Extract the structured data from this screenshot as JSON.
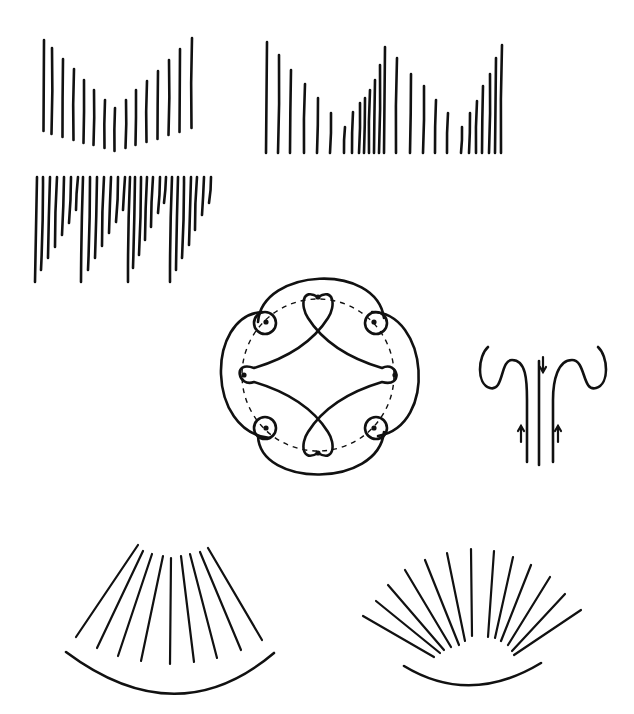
{
  "page": {
    "width": 634,
    "height": 714,
    "background": "#ffffff",
    "ink": "#111111"
  },
  "figures": {
    "v_comb": {
      "lines": [
        [
          44,
          40,
          131
        ],
        [
          52,
          48,
          134
        ],
        [
          63,
          59,
          137
        ],
        [
          74,
          69,
          140
        ],
        [
          84,
          80,
          143
        ],
        [
          94,
          90,
          145
        ],
        [
          105,
          100,
          148
        ],
        [
          115,
          108,
          151
        ],
        [
          126,
          100,
          148
        ],
        [
          136,
          90,
          145
        ],
        [
          147,
          81,
          142
        ],
        [
          158,
          71,
          139
        ],
        [
          169,
          60,
          135
        ],
        [
          180,
          49,
          132
        ],
        [
          192,
          38,
          128
        ]
      ]
    },
    "double_sawtooth_comb": {
      "bottom": 153,
      "lines": [
        [
          267,
          42
        ],
        [
          279,
          55
        ],
        [
          291,
          70
        ],
        [
          305,
          84
        ],
        [
          318,
          98
        ],
        [
          331,
          113
        ],
        [
          345,
          127
        ],
        [
          353,
          112
        ],
        [
          360,
          103
        ],
        [
          365,
          98
        ],
        [
          370,
          90
        ],
        [
          375,
          80
        ],
        [
          380,
          65
        ],
        [
          385,
          47
        ],
        [
          397,
          58
        ],
        [
          411,
          74
        ],
        [
          424,
          86
        ],
        [
          436,
          100
        ],
        [
          448,
          113
        ],
        [
          462,
          127
        ],
        [
          470,
          113
        ],
        [
          477,
          101
        ],
        [
          483,
          86
        ],
        [
          490,
          74
        ],
        [
          496,
          58
        ],
        [
          502,
          45
        ]
      ]
    },
    "hanging_sawtooth": {
      "top": 177,
      "lines": [
        [
          36,
          282
        ],
        [
          42,
          270
        ],
        [
          49,
          258
        ],
        [
          56,
          247
        ],
        [
          63,
          235
        ],
        [
          70,
          223
        ],
        [
          77,
          210
        ],
        [
          82,
          282
        ],
        [
          89,
          270
        ],
        [
          96,
          258
        ],
        [
          103,
          246
        ],
        [
          110,
          233
        ],
        [
          117,
          222
        ],
        [
          124,
          210
        ],
        [
          129,
          282
        ],
        [
          134,
          268
        ],
        [
          140,
          255
        ],
        [
          146,
          240
        ],
        [
          152,
          227
        ],
        [
          159,
          213
        ],
        [
          165,
          203
        ],
        [
          171,
          282
        ],
        [
          177,
          270
        ],
        [
          183,
          258
        ],
        [
          190,
          245
        ],
        [
          196,
          230
        ],
        [
          203,
          215
        ],
        [
          210,
          203
        ]
      ]
    },
    "knot_circle": {
      "center": [
        318,
        375
      ],
      "dashed_radius": 76,
      "dots": [
        [
          318,
          297
        ],
        [
          374,
          322
        ],
        [
          395,
          375
        ],
        [
          374,
          428
        ],
        [
          318,
          453
        ],
        [
          266,
          428
        ],
        [
          244,
          375
        ],
        [
          266,
          322
        ]
      ]
    },
    "fountain": {
      "arrows": [
        {
          "x": 543,
          "y1": 357,
          "y2": 372,
          "dir": "down"
        },
        {
          "x": 521,
          "y1": 442,
          "y2": 426,
          "dir": "up"
        },
        {
          "x": 558,
          "y1": 442,
          "y2": 426,
          "dir": "up"
        }
      ]
    },
    "fan_arc": {
      "lines": [
        [
          138,
          545,
          76,
          637
        ],
        [
          143,
          551,
          97,
          648
        ],
        [
          152,
          554,
          118,
          656
        ],
        [
          163,
          556,
          141,
          661
        ],
        [
          171,
          558,
          170,
          664
        ],
        [
          181,
          556,
          194,
          662
        ],
        [
          190,
          554,
          217,
          658
        ],
        [
          200,
          552,
          241,
          650
        ],
        [
          208,
          548,
          262,
          640
        ]
      ],
      "arc": "M 66 652 Q 177 735 274 653"
    },
    "sunburst": {
      "lines": [
        [
          363,
          616,
          434,
          657
        ],
        [
          376,
          601,
          440,
          653
        ],
        [
          388,
          585,
          444,
          650
        ],
        [
          405,
          570,
          451,
          647
        ],
        [
          425,
          560,
          459,
          645
        ],
        [
          447,
          553,
          465,
          641
        ],
        [
          471,
          549,
          472,
          636
        ],
        [
          494,
          551,
          488,
          637
        ],
        [
          513,
          557,
          495,
          638
        ],
        [
          531,
          565,
          501,
          641
        ],
        [
          550,
          577,
          508,
          645
        ],
        [
          565,
          594,
          512,
          651
        ],
        [
          581,
          610,
          514,
          655
        ]
      ],
      "arc": "M 404 666 Q 470 706 541 663"
    }
  }
}
